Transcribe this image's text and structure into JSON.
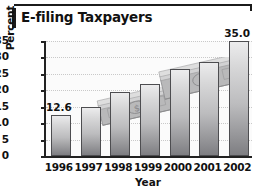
{
  "chart_data": {
    "type": "bar",
    "title": "E-filing Taxpayers",
    "xlabel": "Year",
    "ylabel": "Percent",
    "categories": [
      "1996",
      "1997",
      "1998",
      "1999",
      "2000",
      "2001",
      "2002"
    ],
    "values": [
      12.6,
      15.0,
      19.5,
      21.8,
      26.4,
      28.7,
      35.0
    ],
    "value_labels": [
      {
        "category": "1996",
        "text": "12.6"
      },
      {
        "category": "2002",
        "text": "35.0"
      }
    ],
    "ylim": [
      0,
      35
    ],
    "ytick_labels": [
      "35",
      "30",
      "25",
      "20",
      "15",
      "10",
      "5",
      "0"
    ],
    "yticks": [
      35,
      30,
      25,
      20,
      15,
      10,
      5,
      0
    ],
    "grid": true,
    "legend": false,
    "bar_color": "#bcbcbe",
    "bar_edge_color": "#4d4d50",
    "axis_color": "#222222",
    "background_color": "#fbfbfb",
    "decorations": [
      {
        "name": "money-stack-left",
        "description": "tilted stack of dollar bills"
      },
      {
        "name": "money-stack-right",
        "description": "tilted stack of dollar bills"
      }
    ]
  }
}
